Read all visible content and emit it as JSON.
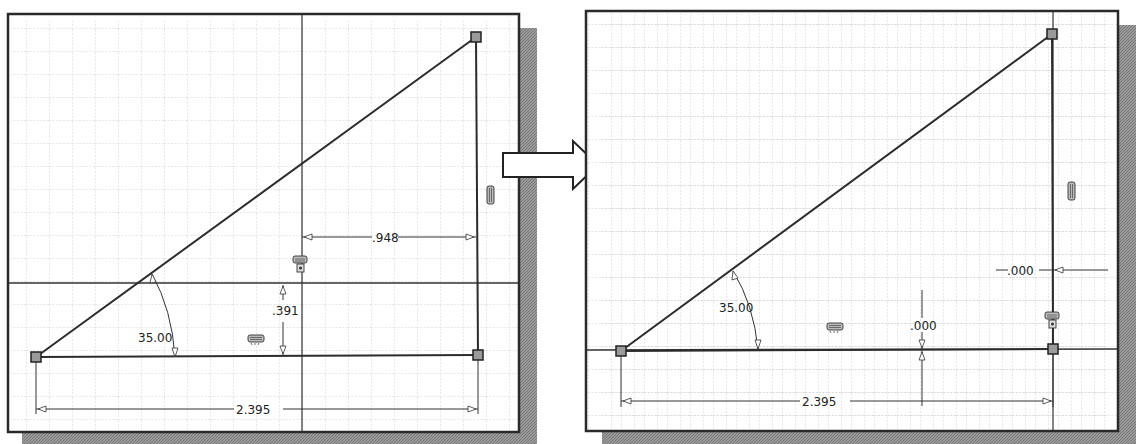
{
  "colors": {
    "background": "#ffffff",
    "panel_border": "#2a2a2a",
    "grid": "#bdbdbd",
    "geometry": "#2b2b2b",
    "dimension": "#333333",
    "shadow": "#8c8c8c",
    "point_fill": "#9a9a9a"
  },
  "transition_arrow": {
    "icon": "right-arrow-icon"
  },
  "panels": [
    {
      "id": "before",
      "dimensions": {
        "angle": "35.00",
        "base_length": "2.395",
        "horizontal_offset": ".948",
        "vertical_offset": ".391"
      },
      "constraint_icons": [
        "vertical-constraint-icon",
        "fix-constraint-icon",
        "horizontal-constraint-icon"
      ]
    },
    {
      "id": "after",
      "dimensions": {
        "angle": "35.00",
        "base_length": "2.395",
        "horizontal_offset": ".000",
        "vertical_offset": ".000"
      },
      "constraint_icons": [
        "vertical-constraint-icon",
        "fix-constraint-icon",
        "horizontal-constraint-icon"
      ]
    }
  ]
}
